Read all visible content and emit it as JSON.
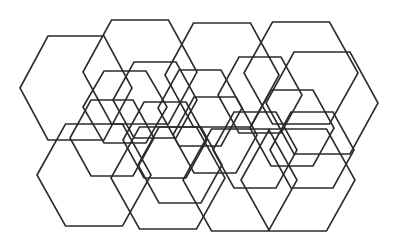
{
  "figure": {
    "stroke_color": "#2b2b2b",
    "background": "#ffffff",
    "hexagons": [
      {
        "cx": 76,
        "cy": 88,
        "r": 56,
        "h": 52
      },
      {
        "cx": 140,
        "cy": 72,
        "r": 57,
        "h": 52
      },
      {
        "cx": 222,
        "cy": 75,
        "r": 57,
        "h": 52
      },
      {
        "cx": 301,
        "cy": 73,
        "r": 57,
        "h": 51
      },
      {
        "cx": 322,
        "cy": 103,
        "r": 56,
        "h": 51
      },
      {
        "cx": 94,
        "cy": 175,
        "r": 57,
        "h": 51
      },
      {
        "cx": 168,
        "cy": 178,
        "r": 57,
        "h": 51
      },
      {
        "cx": 240,
        "cy": 180,
        "r": 57,
        "h": 51
      },
      {
        "cx": 298,
        "cy": 180,
        "r": 57,
        "h": 51
      },
      {
        "cx": 125,
        "cy": 107,
        "r": 42,
        "h": 36
      },
      {
        "cx": 155,
        "cy": 100,
        "r": 42,
        "h": 38
      },
      {
        "cx": 200,
        "cy": 108,
        "r": 42,
        "h": 38
      },
      {
        "cx": 260,
        "cy": 95,
        "r": 42,
        "h": 38
      },
      {
        "cx": 292,
        "cy": 128,
        "r": 42,
        "h": 38
      },
      {
        "cx": 112,
        "cy": 138,
        "r": 42,
        "h": 38
      },
      {
        "cx": 165,
        "cy": 140,
        "r": 42,
        "h": 38
      },
      {
        "cx": 215,
        "cy": 135,
        "r": 42,
        "h": 38
      },
      {
        "cx": 255,
        "cy": 150,
        "r": 42,
        "h": 38
      },
      {
        "cx": 312,
        "cy": 150,
        "r": 42,
        "h": 38
      },
      {
        "cx": 180,
        "cy": 165,
        "r": 42,
        "h": 38
      }
    ]
  }
}
